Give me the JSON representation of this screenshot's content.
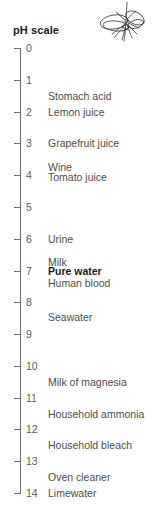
{
  "title": "pH scale",
  "decoration": {
    "icon": "insect-line-drawing"
  },
  "colors": {
    "axis": "#6e6e6e",
    "tick_label": "#5a5a5a",
    "substance_label": "#4d4d4d",
    "title": "#1a1a1a",
    "highlight": "#1a1a1a",
    "background": "#ffffff"
  },
  "chart_data": {
    "type": "scatter",
    "title": "pH scale",
    "xlabel": "",
    "ylabel": "pH",
    "ylim": [
      0,
      14
    ],
    "axis_orientation": "vertical",
    "grid": false,
    "legend": "none",
    "tick_labels": [
      "0",
      "1",
      "2",
      "3",
      "4",
      "5",
      "6",
      "7",
      "8",
      "9",
      "10",
      "11",
      "12",
      "13",
      "14"
    ],
    "tick_values": [
      0,
      1,
      2,
      3,
      4,
      5,
      6,
      7,
      8,
      9,
      10,
      11,
      12,
      13,
      14
    ],
    "annotations": [
      {
        "label": "Stomach acid",
        "ph": 1.5,
        "bold": false
      },
      {
        "label": "Lemon juice",
        "ph": 2.0,
        "bold": false
      },
      {
        "label": "Grapefruit juice",
        "ph": 3.0,
        "bold": false
      },
      {
        "label": "Wine",
        "ph": 3.75,
        "bold": false
      },
      {
        "label": "Tomato juice",
        "ph": 4.05,
        "bold": false
      },
      {
        "label": "Urine",
        "ph": 6.0,
        "bold": false
      },
      {
        "label": "Milk",
        "ph": 6.72,
        "bold": false
      },
      {
        "label": "Pure water",
        "ph": 7.0,
        "bold": true
      },
      {
        "label": "Human blood",
        "ph": 7.38,
        "bold": false
      },
      {
        "label": "Seawater",
        "ph": 8.45,
        "bold": false
      },
      {
        "label": "Milk of magnesia",
        "ph": 10.5,
        "bold": false
      },
      {
        "label": "Household ammonia",
        "ph": 11.5,
        "bold": false
      },
      {
        "label": "Household bleach",
        "ph": 12.5,
        "bold": false
      },
      {
        "label": "Oven cleaner",
        "ph": 13.5,
        "bold": false
      },
      {
        "label": "Limewater",
        "ph": 14.0,
        "bold": false
      }
    ]
  }
}
